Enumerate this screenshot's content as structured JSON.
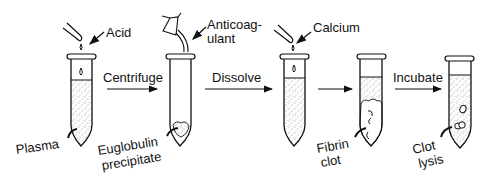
{
  "diagram": {
    "reagents": {
      "acid": "Acid",
      "anticoagulant_line1": "Anticoag-",
      "anticoagulant_line2": "ulant",
      "calcium": "Calcium"
    },
    "steps": {
      "centrifuge": "Centrifuge",
      "dissolve": "Dissolve",
      "incubate": "Incubate"
    },
    "tube_labels": {
      "plasma": "Plasma",
      "euglobulin_line1": "Euglobulin",
      "euglobulin_line2": "precipitate",
      "fibrin_line1": "Fibrin",
      "fibrin_line2": "clot",
      "clot_line1": "Clot",
      "clot_line2": "lysis"
    },
    "colors": {
      "ink": "#111111",
      "background": "#ffffff"
    }
  }
}
